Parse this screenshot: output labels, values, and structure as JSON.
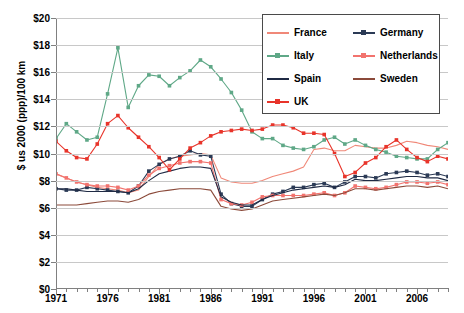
{
  "chart_data": {
    "type": "line",
    "title": "",
    "xlabel": "",
    "ylabel": "$ us 2000 (ppp)/100 km",
    "xlim": [
      1971,
      2009
    ],
    "ylim": [
      0,
      20
    ],
    "ytick_step": 2,
    "ytick_labels": [
      "$0",
      "$2",
      "$4",
      "$6",
      "$8",
      "$10",
      "$12",
      "$14",
      "$16",
      "$18",
      "$20"
    ],
    "ytick_values": [
      0,
      2,
      4,
      6,
      8,
      10,
      12,
      14,
      16,
      18,
      20
    ],
    "xtick_labels": [
      "1971",
      "1976",
      "1981",
      "1986",
      "1991",
      "1996",
      "2001",
      "2006"
    ],
    "xtick_values": [
      1971,
      1976,
      1981,
      1986,
      1991,
      1996,
      2001,
      2006
    ],
    "grid": "horizontal",
    "legend_position": "top-right",
    "x": [
      1971,
      1972,
      1973,
      1974,
      1975,
      1976,
      1977,
      1978,
      1979,
      1980,
      1981,
      1982,
      1983,
      1984,
      1985,
      1986,
      1987,
      1988,
      1989,
      1990,
      1991,
      1992,
      1993,
      1994,
      1995,
      1996,
      1997,
      1998,
      1999,
      2000,
      2001,
      2002,
      2003,
      2004,
      2005,
      2006,
      2007,
      2008,
      2009
    ],
    "series": [
      {
        "name": "France",
        "color": "#F08878",
        "marker": "none",
        "values": [
          8.5,
          8.2,
          7.9,
          7.7,
          7.5,
          7.4,
          7.3,
          7.1,
          7.3,
          8.3,
          9.2,
          9.6,
          9.8,
          9.9,
          10.0,
          9.9,
          8.2,
          7.9,
          7.8,
          7.8,
          8.0,
          8.3,
          8.5,
          8.7,
          9.0,
          10.3,
          10.4,
          10.2,
          10.2,
          10.6,
          10.5,
          10.4,
          10.4,
          10.6,
          10.9,
          10.8,
          10.6,
          10.5,
          10.3
        ]
      },
      {
        "name": "Germany",
        "color": "#2B3A55",
        "marker": "square",
        "values": [
          7.4,
          7.3,
          7.3,
          7.5,
          7.4,
          7.3,
          7.2,
          7.1,
          7.6,
          8.7,
          9.2,
          9.6,
          9.8,
          10.2,
          9.9,
          9.8,
          7.0,
          6.3,
          6.1,
          6.1,
          6.6,
          7.0,
          7.2,
          7.5,
          7.5,
          7.7,
          7.8,
          7.5,
          7.9,
          8.3,
          8.3,
          8.2,
          8.5,
          8.6,
          8.7,
          8.6,
          8.4,
          8.5,
          8.3
        ]
      },
      {
        "name": "Italy",
        "color": "#5FA887",
        "marker": "square",
        "values": [
          11.1,
          12.2,
          11.6,
          11.0,
          11.2,
          14.4,
          17.8,
          13.4,
          15.0,
          15.8,
          15.7,
          15.0,
          15.6,
          16.1,
          16.9,
          16.4,
          15.5,
          14.5,
          13.2,
          11.6,
          11.1,
          11.1,
          10.6,
          10.4,
          10.3,
          10.5,
          11.0,
          11.2,
          10.7,
          11.0,
          10.6,
          10.3,
          10.1,
          9.8,
          9.7,
          9.6,
          9.6,
          10.3,
          10.8
        ]
      },
      {
        "name": "Netherlands",
        "color": "#F2736E",
        "marker": "square",
        "values": [
          8.5,
          8.2,
          7.9,
          7.7,
          7.6,
          7.6,
          7.5,
          7.3,
          7.6,
          8.4,
          8.9,
          9.1,
          9.3,
          9.4,
          9.4,
          9.3,
          6.6,
          6.3,
          6.2,
          6.4,
          6.8,
          6.9,
          6.9,
          6.9,
          6.9,
          7.0,
          7.1,
          6.9,
          7.1,
          7.6,
          7.5,
          7.4,
          7.5,
          7.7,
          7.9,
          7.9,
          7.8,
          7.9,
          7.7
        ]
      },
      {
        "name": "Spain",
        "color": "#1F2A44",
        "marker": "none",
        "values": [
          7.4,
          7.4,
          7.3,
          7.2,
          7.2,
          7.2,
          7.2,
          7.1,
          7.4,
          8.0,
          8.5,
          8.7,
          8.9,
          9.0,
          9.0,
          8.9,
          6.8,
          6.4,
          6.2,
          6.2,
          6.6,
          6.9,
          7.1,
          7.3,
          7.4,
          7.5,
          7.6,
          7.5,
          7.7,
          8.1,
          8.0,
          8.0,
          8.1,
          8.2,
          8.3,
          8.3,
          8.2,
          8.2,
          8.0
        ]
      },
      {
        "name": "Sweden",
        "color": "#8B4A3A",
        "marker": "none",
        "values": [
          6.2,
          6.2,
          6.2,
          6.3,
          6.4,
          6.5,
          6.5,
          6.4,
          6.6,
          7.0,
          7.2,
          7.3,
          7.4,
          7.4,
          7.4,
          7.3,
          6.1,
          5.9,
          5.8,
          5.9,
          6.2,
          6.5,
          6.6,
          6.7,
          6.8,
          6.9,
          7.0,
          6.9,
          7.1,
          7.4,
          7.4,
          7.3,
          7.4,
          7.5,
          7.6,
          7.6,
          7.5,
          7.6,
          7.4
        ]
      },
      {
        "name": "UK",
        "color": "#E8342A",
        "marker": "square",
        "values": [
          10.9,
          10.2,
          9.7,
          9.6,
          10.7,
          12.2,
          12.8,
          11.9,
          11.2,
          10.5,
          9.7,
          8.8,
          9.6,
          10.4,
          10.8,
          11.3,
          11.6,
          11.7,
          11.8,
          11.7,
          11.8,
          12.1,
          12.1,
          11.9,
          11.5,
          11.5,
          11.4,
          10.0,
          8.3,
          8.6,
          9.3,
          9.7,
          10.5,
          11.0,
          10.3,
          9.7,
          9.4,
          9.8,
          9.6
        ]
      }
    ]
  }
}
